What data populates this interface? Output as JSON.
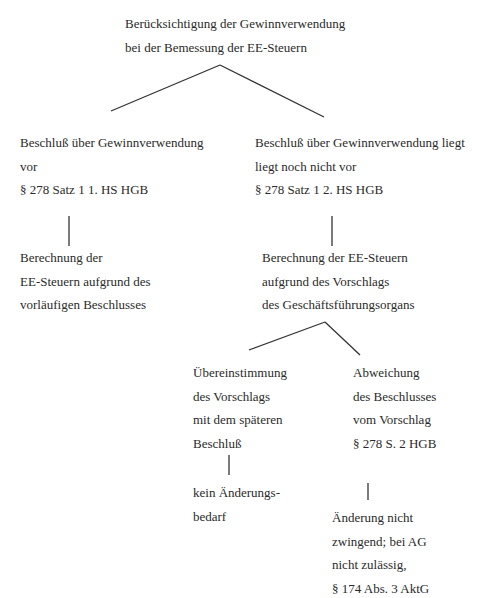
{
  "diagram": {
    "root": {
      "lines": [
        "Berücksichtigung der Gewinnverwendung",
        "bei der Bemessung der EE-Steuern"
      ]
    },
    "left_branch": {
      "condition": [
        "Beschluß über Gewinnverwendung",
        "vor",
        "§ 278 Satz 1 1. HS HGB"
      ],
      "result": [
        "Berechnung der",
        "EE-Steuern aufgrund des",
        "vorläufigen Beschlusses"
      ]
    },
    "right_branch": {
      "condition": [
        "Beschluß über Gewinnverwendung liegt",
        "liegt noch nicht vor",
        "§ 278 Satz 1 2. HS HGB"
      ],
      "result": [
        "Berechnung der EE-Steuern",
        "aufgrund des Vorschlags",
        "des Geschäftsführungsorgans"
      ],
      "sub_left": {
        "condition": [
          "Übereinstimmung",
          "des Vorschlags",
          "mit dem späteren",
          "Beschluß"
        ],
        "result": [
          "kein Änderungs-",
          "bedarf"
        ]
      },
      "sub_right": {
        "condition": [
          "Abweichung",
          "des Beschlusses",
          "vom Vorschlag",
          "§ 278 S. 2 HGB"
        ],
        "result": [
          "Änderung nicht",
          "zwingend; bei AG",
          "nicht zulässig,",
          "§ 174 Abs. 3 AktG"
        ]
      }
    }
  }
}
